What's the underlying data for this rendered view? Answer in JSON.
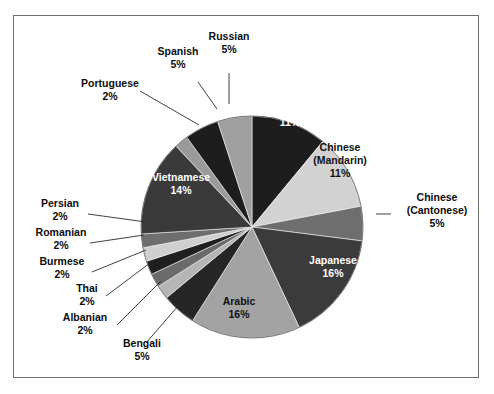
{
  "figure": {
    "frame_border_color": "#6f6f6f",
    "background_color": "#ffffff"
  },
  "chart_data": {
    "type": "pie",
    "title": "",
    "subtitle": "",
    "xlabel": "",
    "ylabel": "",
    "legend_position": "none",
    "grid": false,
    "units": "percent",
    "start_angle_deg": 0,
    "direction": "clockwise",
    "categories": [
      "Korean",
      "Chinese (Mandarin)",
      "Chinese (Cantonese)",
      "Japanese",
      "Arabic",
      "Bengali",
      "Albanian",
      "Thai",
      "Burmese",
      "Romanian",
      "Persian",
      "Vietnamese",
      "Portuguese",
      "Spanish",
      "Russian"
    ],
    "values": [
      11,
      11,
      5,
      16,
      16,
      5,
      2,
      2,
      2,
      2,
      2,
      14,
      2,
      5,
      5
    ],
    "slices": [
      {
        "name": "Korean",
        "label": "Korean",
        "value": 11,
        "value_text": "11%",
        "color": "#1d1d1d",
        "label_placement": "inside",
        "label_text_color": "#ffffff"
      },
      {
        "name": "Chinese (Mandarin)",
        "label_line1": "Chinese",
        "label_line2": "(Mandarin)",
        "value": 11,
        "value_text": "11%",
        "color": "#d2d2d2",
        "label_placement": "inside",
        "label_text_color": "#111111"
      },
      {
        "name": "Chinese (Cantonese)",
        "label_line1": "Chinese",
        "label_line2": "(Cantonese)",
        "value": 5,
        "value_text": "5%",
        "color": "#6e6e6e",
        "label_placement": "outside",
        "label_text_color": "#0d0d0d"
      },
      {
        "name": "Japanese",
        "label": "Japanese",
        "value": 16,
        "value_text": "16%",
        "color": "#3b3b3b",
        "label_placement": "inside",
        "label_text_color": "#ffffff"
      },
      {
        "name": "Arabic",
        "label": "Arabic",
        "value": 16,
        "value_text": "16%",
        "color": "#a3a3a3",
        "label_placement": "inside",
        "label_text_color": "#111111"
      },
      {
        "name": "Bengali",
        "label": "Bengali",
        "value": 5,
        "value_text": "5%",
        "color": "#262626",
        "label_placement": "outside",
        "label_text_color": "#0d0d0d"
      },
      {
        "name": "Albanian",
        "label": "Albanian",
        "value": 2,
        "value_text": "2%",
        "color": "#b5b5b5",
        "label_placement": "outside",
        "label_text_color": "#0d0d0d"
      },
      {
        "name": "Thai",
        "label": "Thai",
        "value": 2,
        "value_text": "2%",
        "color": "#6b6b6b",
        "label_placement": "outside",
        "label_text_color": "#0d0d0d"
      },
      {
        "name": "Burmese",
        "label": "Burmese",
        "value": 2,
        "value_text": "2%",
        "color": "#1f1f1f",
        "label_placement": "outside",
        "label_text_color": "#0d0d0d"
      },
      {
        "name": "Romanian",
        "label": "Romanian",
        "value": 2,
        "value_text": "2%",
        "color": "#cfcfcf",
        "label_placement": "outside",
        "label_text_color": "#0d0d0d"
      },
      {
        "name": "Persian",
        "label": "Persian",
        "value": 2,
        "value_text": "2%",
        "color": "#6e6e6e",
        "label_placement": "outside",
        "label_text_color": "#0d0d0d"
      },
      {
        "name": "Vietnamese",
        "label": "Vietnamese",
        "value": 14,
        "value_text": "14%",
        "color": "#3a3a3a",
        "label_placement": "inside",
        "label_text_color": "#ffffff"
      },
      {
        "name": "Portuguese",
        "label": "Portuguese",
        "value": 2,
        "value_text": "2%",
        "color": "#9a9a9a",
        "label_placement": "outside",
        "label_text_color": "#0d0d0d"
      },
      {
        "name": "Spanish",
        "label": "Spanish",
        "value": 5,
        "value_text": "5%",
        "color": "#1d1d1d",
        "label_placement": "outside",
        "label_text_color": "#0d0d0d"
      },
      {
        "name": "Russian",
        "label": "Russian",
        "value": 5,
        "value_text": "5%",
        "color": "#9f9f9f",
        "label_placement": "outside",
        "label_text_color": "#0d0d0d"
      }
    ]
  },
  "labels": {
    "korean": {
      "name": "Korean",
      "pct": "11%"
    },
    "mandarin": {
      "l1": "Chinese",
      "l2": "(Mandarin)",
      "pct": "11%"
    },
    "cantonese": {
      "l1": "Chinese",
      "l2": "(Cantonese)",
      "pct": "5%"
    },
    "japanese": {
      "name": "Japanese",
      "pct": "16%"
    },
    "arabic": {
      "name": "Arabic",
      "pct": "16%"
    },
    "bengali": {
      "name": "Bengali",
      "pct": "5%"
    },
    "albanian": {
      "name": "Albanian",
      "pct": "2%"
    },
    "thai": {
      "name": "Thai",
      "pct": "2%"
    },
    "burmese": {
      "name": "Burmese",
      "pct": "2%"
    },
    "romanian": {
      "name": "Romanian",
      "pct": "2%"
    },
    "persian": {
      "name": "Persian",
      "pct": "2%"
    },
    "vietnamese": {
      "name": "Vietnamese",
      "pct": "14%"
    },
    "portuguese": {
      "name": "Portuguese",
      "pct": "2%"
    },
    "spanish": {
      "name": "Spanish",
      "pct": "5%"
    },
    "russian": {
      "name": "Russian",
      "pct": "5%"
    }
  }
}
